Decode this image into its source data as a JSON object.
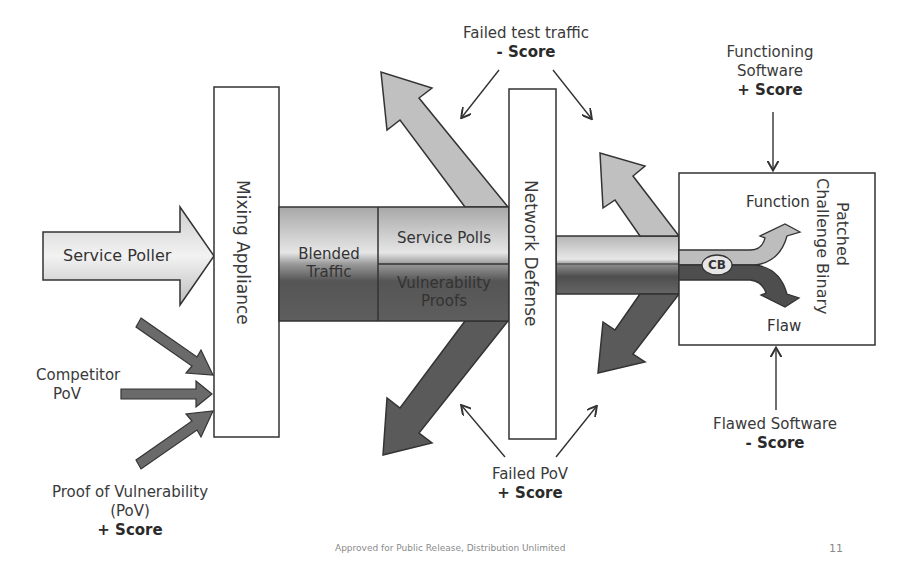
{
  "diagram": {
    "nodes": {
      "service_poller": "Service Poller",
      "mixing_appliance": "Mixing Appliance",
      "blended_traffic_line1": "Blended",
      "blended_traffic_line2": "Traffic",
      "service_polls": "Service Polls",
      "vulnerability_proofs_line1": "Vulnerability",
      "vulnerability_proofs_line2": "Proofs",
      "network_defense": "Network Defense",
      "patched_cb_line1": "Patched",
      "patched_cb_line2": "Challenge Binary",
      "cb_badge": "CB",
      "function": "Function",
      "flaw": "Flaw"
    },
    "annotations": {
      "competitor_pov": {
        "line1": "Competitor",
        "line2": "PoV"
      },
      "proof_of_vulnerability": {
        "line1": "Proof of Vulnerability",
        "line2": "(PoV)",
        "score": "+ Score"
      },
      "failed_test_traffic": {
        "line1": "Failed test traffic",
        "score": "- Score"
      },
      "failed_pov": {
        "line1": "Failed PoV",
        "score": "+ Score"
      },
      "functioning_software": {
        "line1": "Functioning",
        "line2": "Software",
        "score": "+ Score"
      },
      "flawed_software": {
        "line1": "Flawed Software",
        "score": "- Score"
      }
    }
  },
  "footer": {
    "text": "Approved for Public Release, Distribution Unlimited",
    "page_number": "11"
  },
  "colors": {
    "light_fill": "#c8c8c8",
    "dark_fill": "#5a5a5a",
    "stroke": "#333333"
  }
}
